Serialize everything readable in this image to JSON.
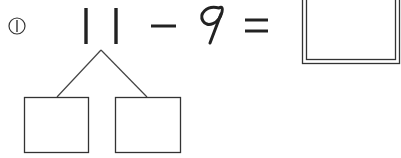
{
  "problem": {
    "index_label": "①",
    "operand1_digits": [
      "1",
      "1"
    ],
    "operand1": "11",
    "operator": "−",
    "operand2": "9",
    "equals": "=",
    "answer": ""
  },
  "decomposition": {
    "left_box": "",
    "right_box": ""
  },
  "colors": {
    "ink": "#222222",
    "line": "#444444",
    "background": "#ffffff"
  }
}
